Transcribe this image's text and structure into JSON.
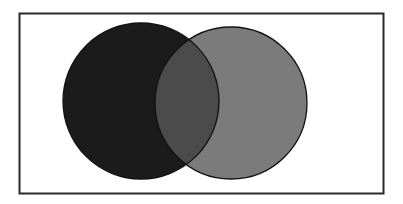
{
  "diagram": {
    "type": "venn",
    "sets": [
      {
        "name": "set-a",
        "label": "",
        "color": "#1b1b1b"
      },
      {
        "name": "set-b",
        "label": "",
        "color": "#7b7b7b"
      }
    ],
    "intersection": {
      "name": "a-and-b",
      "label": "",
      "color": "#4b4b4b"
    },
    "frame_color": "#2a2a2a",
    "outline_color": "#111111",
    "background": "#ffffff"
  }
}
